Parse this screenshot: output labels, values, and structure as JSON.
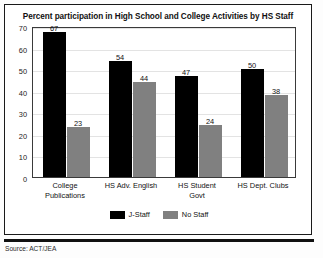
{
  "chart_data": {
    "type": "bar",
    "title": "Percent participation in High School and College Activities by HS Staff",
    "xlabel": "",
    "ylabel": "",
    "ylim": [
      0,
      70
    ],
    "yticks": [
      0,
      10,
      20,
      30,
      40,
      50,
      60,
      70
    ],
    "grid": true,
    "legend_position": "bottom",
    "categories": [
      "College\nPublications",
      "HS Adv. English",
      "HS Student\nGovt",
      "HS Dept. Clubs"
    ],
    "series": [
      {
        "name": "J-Staff",
        "color": "#000000",
        "values": [
          67,
          54,
          47,
          50
        ]
      },
      {
        "name": "No Staff",
        "color": "#808080",
        "values": [
          23,
          44,
          24,
          38
        ]
      }
    ]
  },
  "footer": {
    "source": "Source: ACT/JEA"
  }
}
